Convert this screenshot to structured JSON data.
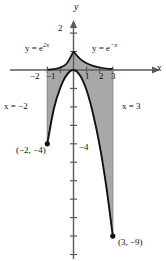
{
  "figure": {
    "background_color": "#ffffff",
    "shade_color": "#a8a8a8",
    "curve_color": "#111111",
    "axis_color": "#5a5a5a"
  },
  "axes": {
    "x_axis_label": "x",
    "y_axis_label": "y",
    "x_ticks": [
      {
        "value": -2,
        "label": "−2"
      },
      {
        "value": -1,
        "label": "−1"
      },
      {
        "value": 1,
        "label": "1"
      },
      {
        "value": 2,
        "label": "2"
      },
      {
        "value": 3,
        "label": "3"
      }
    ],
    "y_ticks": [
      {
        "value": 2,
        "label": "2"
      },
      {
        "value": -4,
        "label": "−4"
      }
    ],
    "xlim": [
      -2.9,
      3.9
    ],
    "ylim": [
      -10.6,
      2.9
    ]
  },
  "curve_labels": {
    "left_curve": {
      "base": "y = e",
      "exponent": "2x",
      "full": "y = e^{2x}"
    },
    "right_curve": {
      "base": "y = e",
      "exponent": "−x",
      "full": "y = e^{-x}"
    }
  },
  "vertical_lines": [
    {
      "label_base": "x = ",
      "label_value": "−2",
      "full": "x = −2",
      "x": -2
    },
    {
      "label_base": "x = ",
      "label_value": "3",
      "full": "x = 3",
      "x": 3
    }
  ],
  "points": [
    {
      "label": "(−2, −4)",
      "x": -2,
      "y": -4
    },
    {
      "label": "(3, −9)",
      "x": 3,
      "y": -9
    }
  ],
  "chart_data": {
    "type": "line",
    "title": "",
    "xlabel": "x",
    "ylabel": "y",
    "xlim": [
      -2.9,
      3.9
    ],
    "ylim": [
      -10.6,
      2.9
    ],
    "grid": false,
    "legend": "inline-curve-labels",
    "series": [
      {
        "name": "y = e^{2x}",
        "domain": [
          -2,
          0
        ],
        "description": "upper boundary for x in [-2, 0]",
        "points": [
          {
            "x": -2,
            "y": 0.018
          },
          {
            "x": -1.5,
            "y": 0.05
          },
          {
            "x": -1,
            "y": 0.135
          },
          {
            "x": -0.5,
            "y": 0.368
          },
          {
            "x": 0,
            "y": 1
          }
        ]
      },
      {
        "name": "y = e^{-x}",
        "domain": [
          0,
          3
        ],
        "description": "upper boundary for x in [0, 3]",
        "points": [
          {
            "x": 0,
            "y": 1
          },
          {
            "x": 0.5,
            "y": 0.607
          },
          {
            "x": 1,
            "y": 0.368
          },
          {
            "x": 1.5,
            "y": 0.223
          },
          {
            "x": 2,
            "y": 0.135
          },
          {
            "x": 2.5,
            "y": 0.082
          },
          {
            "x": 3,
            "y": 0.05
          }
        ]
      },
      {
        "name": "lower boundary curve",
        "domain": [
          -2,
          3
        ],
        "description": "downward-opening curve from (-2,-4) through (0,0) to (3,-9)",
        "points": [
          {
            "x": -2,
            "y": -4
          },
          {
            "x": -1.5,
            "y": -2.1
          },
          {
            "x": -1,
            "y": -0.95
          },
          {
            "x": -0.5,
            "y": -0.25
          },
          {
            "x": 0,
            "y": 0
          },
          {
            "x": 0.5,
            "y": -0.3
          },
          {
            "x": 1,
            "y": -1.1
          },
          {
            "x": 1.5,
            "y": -2.4
          },
          {
            "x": 2,
            "y": -4.1
          },
          {
            "x": 2.5,
            "y": -6.3
          },
          {
            "x": 3,
            "y": -9
          }
        ]
      }
    ],
    "shaded_region": {
      "description": "Region between the exponential upper boundary and the lower curve, bounded left by x = -2 and right by x = 3",
      "fill": "#a8a8a8"
    },
    "marked_points": [
      {
        "x": -2,
        "y": -4,
        "label": "(−2, −4)"
      },
      {
        "x": 3,
        "y": -9,
        "label": "(3, −9)"
      }
    ],
    "annotations": [
      {
        "text": "y = e^{2x}",
        "x": -1.55,
        "y": 2.1
      },
      {
        "text": "y = e^{-x}",
        "x": 1.1,
        "y": 2.1
      },
      {
        "text": "x = −2",
        "x": -2.85,
        "y": -2.6
      },
      {
        "text": "x = 3",
        "x": 3.25,
        "y": -2.6
      }
    ]
  }
}
